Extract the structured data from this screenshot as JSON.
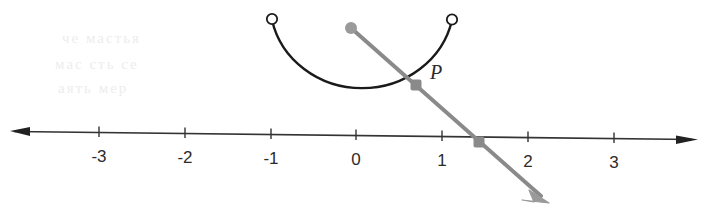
{
  "figure": {
    "background_color": "#ffffff",
    "axis_color": "#333333",
    "arc_color": "#1a1a1a",
    "ray_color": "#8a8a8a",
    "label_color": "#2b2b2b"
  },
  "number_line": {
    "name": "horizontal-number-line",
    "left_arrow": "arrow-left",
    "right_arrow": "arrow-right",
    "ticks": [
      {
        "value": "-3",
        "label": "-3",
        "x": 99
      },
      {
        "value": "-2",
        "label": "-2",
        "x": 185
      },
      {
        "value": "-1",
        "label": "-1",
        "x": 271
      },
      {
        "value": "0",
        "label": "0",
        "x": 356
      },
      {
        "value": "1",
        "label": "1",
        "x": 442
      },
      {
        "value": "2",
        "label": "2",
        "x": 528
      },
      {
        "value": "3",
        "label": "3",
        "x": 614
      }
    ],
    "label_y": 148
  },
  "arc": {
    "name": "semicircular-arc",
    "description": "semicircle opening upward from (-1) to (1)",
    "endpoint_left": {
      "marker": "open-circle",
      "x": 272,
      "y": 20
    },
    "endpoint_right": {
      "marker": "open-circle",
      "x": 452,
      "y": 20
    },
    "bottom_y": 106
  },
  "ray": {
    "name": "terminal-ray",
    "origin_marker": "filled-circle",
    "origin": {
      "x": 351,
      "y": 28
    },
    "arrow_tip": {
      "x": 547,
      "y": 201
    },
    "crossing_marker": "filled-square",
    "crossing": {
      "x": 479,
      "y": 142
    }
  },
  "points": {
    "P": {
      "name": "point-p",
      "label": "P",
      "marker": "filled-square",
      "x": 416,
      "y": 85,
      "label_x": 430,
      "label_y": 62
    }
  },
  "bleed_through": [
    {
      "text": "че мастья",
      "x": 62,
      "y": 36
    },
    {
      "text": "мас сть се",
      "x": 55,
      "y": 62
    },
    {
      "text": "аять мер",
      "x": 58,
      "y": 86
    }
  ]
}
